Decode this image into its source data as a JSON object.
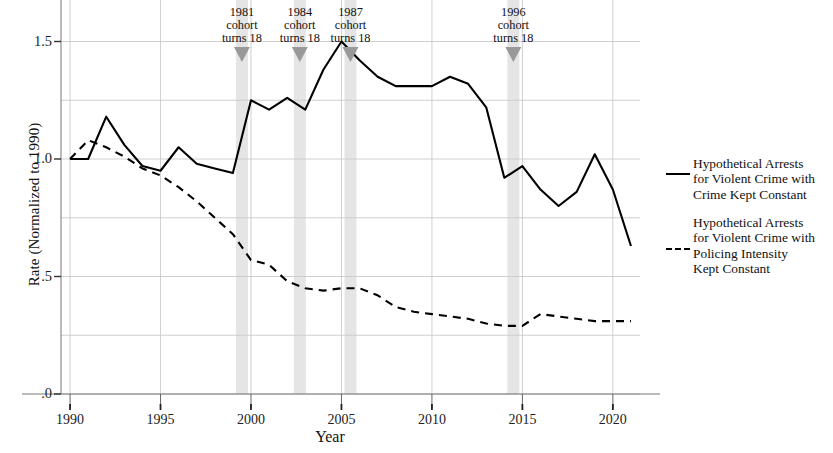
{
  "chart_data": {
    "type": "line",
    "title": "",
    "xlabel": "Year",
    "ylabel": "Rate (Normalized to 1990)",
    "xlim": [
      1989.5,
      2021.5
    ],
    "ylim": [
      0.0,
      1.6
    ],
    "xticks": [
      "1990",
      "1995",
      "2000",
      "2005",
      "2010",
      "2015",
      "2020"
    ],
    "xtick_values": [
      1990,
      1995,
      2000,
      2005,
      2010,
      2015,
      2020
    ],
    "yticks": [
      "1.5",
      "1.0",
      ".5",
      ".0"
    ],
    "ytick_values": [
      1.5,
      1.0,
      0.5,
      0.0
    ],
    "grid": true,
    "legend_position": "right",
    "x": [
      1990,
      1991,
      1992,
      1993,
      1994,
      1995,
      1996,
      1997,
      1998,
      1999,
      2000,
      2001,
      2002,
      2003,
      2004,
      2005,
      2006,
      2007,
      2008,
      2009,
      2010,
      2011,
      2012,
      2013,
      2014,
      2015,
      2016,
      2017,
      2018,
      2019,
      2020,
      2021
    ],
    "series": [
      {
        "name": "Hypothetical Arrests for Violent Crime with Crime Kept Constant",
        "style": "solid",
        "color": "#000000",
        "values": [
          1.0,
          1.0,
          1.18,
          1.06,
          0.97,
          0.95,
          1.05,
          0.98,
          0.96,
          0.94,
          1.25,
          1.21,
          1.26,
          1.21,
          1.38,
          1.5,
          1.42,
          1.35,
          1.31,
          1.31,
          1.31,
          1.35,
          1.32,
          1.22,
          0.92,
          0.97,
          0.87,
          0.8,
          0.86,
          1.02,
          0.87,
          0.63
        ]
      },
      {
        "name": "Hypothetical Arrests for Violent Crime with Policing Intensity Kept Constant",
        "style": "dashed",
        "color": "#000000",
        "values": [
          1.0,
          1.08,
          1.05,
          1.01,
          0.96,
          0.93,
          0.88,
          0.82,
          0.75,
          0.68,
          0.57,
          0.55,
          0.48,
          0.45,
          0.44,
          0.45,
          0.45,
          0.42,
          0.37,
          0.35,
          0.34,
          0.33,
          0.32,
          0.3,
          0.29,
          0.29,
          0.34,
          0.33,
          0.32,
          0.31,
          0.31,
          0.31
        ]
      }
    ],
    "annotations": [
      {
        "year": 1999.5,
        "lines": [
          "1981",
          "cohort",
          "turns 18"
        ],
        "marker": "down-triangle"
      },
      {
        "year": 2002.7,
        "lines": [
          "1984",
          "cohort",
          "turns 18"
        ],
        "marker": "down-triangle"
      },
      {
        "year": 2005.5,
        "lines": [
          "1987",
          "cohort",
          "turns 18"
        ],
        "marker": "down-triangle"
      },
      {
        "year": 2014.5,
        "lines": [
          "1996",
          "cohort",
          "turns 18"
        ],
        "marker": "down-triangle"
      }
    ],
    "band_color": "#e0e0e0",
    "marker_color": "#999999",
    "grid_color": "#c9c9c9"
  },
  "legend": {
    "items": [
      {
        "id": "crime-constant",
        "style": "solid",
        "lines": [
          "Hypothetical Arrests",
          "for Violent Crime with",
          "Crime Kept Constant"
        ]
      },
      {
        "id": "policing-constant",
        "style": "dashed",
        "lines": [
          "Hypothetical Arrests",
          "for Violent Crime with",
          "Policing Intensity",
          "Kept Constant"
        ]
      }
    ]
  }
}
